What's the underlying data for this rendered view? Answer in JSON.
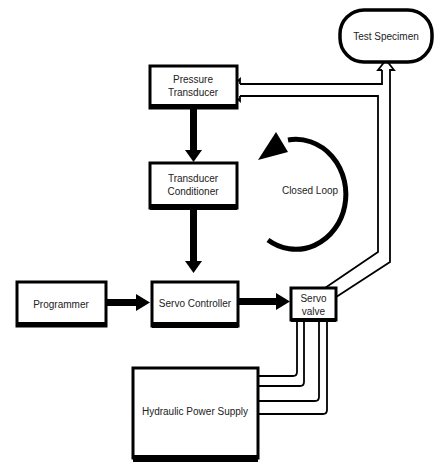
{
  "diagram": {
    "nodes": {
      "pressure_transducer": {
        "line1": "Pressure",
        "line2": "Transducer"
      },
      "transducer_conditioner": {
        "line1": "Transducer",
        "line2": "Conditioner"
      },
      "programmer": {
        "label": "Programmer"
      },
      "servo_controller": {
        "label": "Servo Controller"
      },
      "servo_valve": {
        "line1": "Servo",
        "line2": "valve"
      },
      "hydraulic_power_supply": {
        "label": "Hydraulic Power Supply"
      },
      "test_specimen": {
        "label": "Test Specimen"
      }
    },
    "loop_label": "Closed Loop",
    "edges": [
      {
        "from": "pressure_transducer",
        "to": "transducer_conditioner",
        "style": "solid"
      },
      {
        "from": "transducer_conditioner",
        "to": "servo_controller",
        "style": "solid"
      },
      {
        "from": "programmer",
        "to": "servo_controller",
        "style": "solid"
      },
      {
        "from": "servo_controller",
        "to": "servo_valve",
        "style": "solid"
      },
      {
        "from": "servo_valve",
        "to": "test_specimen",
        "style": "hollow"
      },
      {
        "from": "servo_valve",
        "to": "pressure_transducer",
        "style": "hollow"
      },
      {
        "from": "hydraulic_power_supply",
        "to": "servo_valve",
        "style": "hydraulic-lines",
        "count": 4
      }
    ]
  }
}
